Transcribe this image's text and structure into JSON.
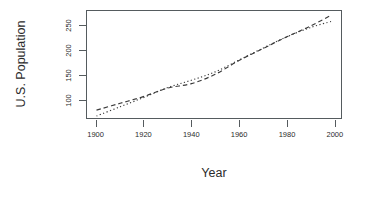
{
  "chart_data": {
    "type": "line",
    "title": "",
    "xlabel": "Year",
    "ylabel": "U.S. Population",
    "xlim": [
      1896,
      2003
    ],
    "ylim": [
      62,
      280
    ],
    "grid": false,
    "legend": "none",
    "xticks": [
      1900,
      1920,
      1940,
      1960,
      1980,
      2000
    ],
    "yticks": [
      100,
      150,
      200,
      250
    ],
    "x": [
      1900,
      1910,
      1920,
      1930,
      1940,
      1950,
      1960,
      1970,
      1980,
      1990,
      1999
    ],
    "series": [
      {
        "name": "dashed-curve",
        "style": "dashed",
        "color": "#3a3a3a",
        "values": [
          78,
          92,
          106,
          123,
          132,
          151,
          179,
          203,
          227,
          249,
          272
        ]
      },
      {
        "name": "dotted-curve",
        "style": "dotted",
        "color": "#3a3a3a",
        "values": [
          66,
          85,
          104,
          124,
          139,
          156,
          180,
          204,
          227,
          246,
          259
        ]
      }
    ]
  },
  "axes": {
    "y_title": "U.S. Population",
    "x_title": "Year",
    "x_tick_labels": [
      "1900",
      "1920",
      "1940",
      "1960",
      "1980",
      "2000"
    ],
    "y_tick_labels": [
      "100",
      "150",
      "200",
      "250"
    ]
  },
  "colors": {
    "background": "#ffffff",
    "axis": "#555b5e",
    "text": "#2b2b2b",
    "line": "#3a3a3a"
  }
}
